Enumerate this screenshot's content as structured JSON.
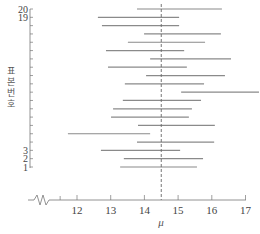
{
  "chart_data": {
    "type": "interval",
    "title": "",
    "xlabel": "μ",
    "ylabel": "표본번호",
    "x_ticks": [
      12,
      13,
      14,
      15,
      16,
      17
    ],
    "x_break_tick": 11.5,
    "xlim": [
      11.5,
      17.4
    ],
    "axis_break": true,
    "y_tick_labels": [
      {
        "row": 1,
        "label": "1"
      },
      {
        "row": 2,
        "label": "2"
      },
      {
        "row": 3,
        "label": "3"
      },
      {
        "row": 19,
        "label": "19"
      },
      {
        "row": 20,
        "label": "20"
      }
    ],
    "reference_line": {
      "value": 14.5,
      "style": "dashed",
      "label": "μ"
    },
    "intervals": [
      {
        "sample": 1,
        "lower": 13.28,
        "upper": 15.56
      },
      {
        "sample": 2,
        "lower": 13.39,
        "upper": 15.74
      },
      {
        "sample": 3,
        "lower": 12.71,
        "upper": 15.06
      },
      {
        "sample": 4,
        "lower": 13.78,
        "upper": 16.07
      },
      {
        "sample": 5,
        "lower": 11.73,
        "upper": 14.17
      },
      {
        "sample": 6,
        "lower": 13.81,
        "upper": 16.09
      },
      {
        "sample": 7,
        "lower": 13.01,
        "upper": 15.32
      },
      {
        "sample": 8,
        "lower": 13.07,
        "upper": 15.41
      },
      {
        "sample": 9,
        "lower": 13.36,
        "upper": 15.68
      },
      {
        "sample": 10,
        "lower": 15.09,
        "upper": 17.4
      },
      {
        "sample": 11,
        "lower": 13.42,
        "upper": 15.77
      },
      {
        "sample": 12,
        "lower": 14.05,
        "upper": 16.39
      },
      {
        "sample": 13,
        "lower": 12.92,
        "upper": 15.26
      },
      {
        "sample": 14,
        "lower": 14.17,
        "upper": 16.57
      },
      {
        "sample": 15,
        "lower": 12.86,
        "upper": 15.18
      },
      {
        "sample": 16,
        "lower": 13.51,
        "upper": 15.8
      },
      {
        "sample": 17,
        "lower": 13.99,
        "upper": 16.27
      },
      {
        "sample": 18,
        "lower": 12.74,
        "upper": 15.03
      },
      {
        "sample": 19,
        "lower": 12.62,
        "upper": 15.03
      },
      {
        "sample": 20,
        "lower": 13.78,
        "upper": 16.3
      }
    ],
    "colors": {
      "interval": "#8a8a8a",
      "axis": "#777777",
      "text": "#444444"
    }
  }
}
